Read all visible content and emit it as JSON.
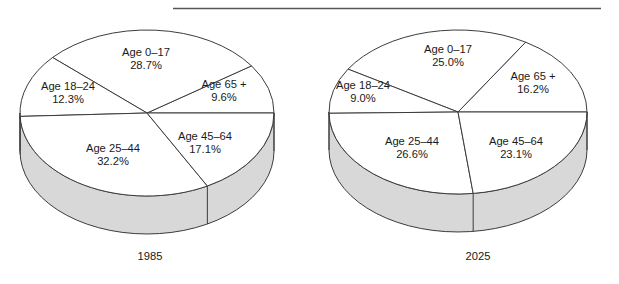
{
  "figure": {
    "top_rule": {
      "visible": true
    },
    "background_color": "#ffffff",
    "outline_color": "#3c3c3c",
    "slice_fill_color": "#ffffff",
    "side_wall_color": "#d8d8d8"
  },
  "chart_data": [
    {
      "type": "pie",
      "title": "1985",
      "xlabel": "",
      "ylabel": "",
      "categories": [
        "Age 65 +",
        "Age 0–17",
        "Age 18–24",
        "Age 25–44",
        "Age 45–64"
      ],
      "values": [
        9.6,
        28.7,
        12.3,
        32.2,
        17.1
      ],
      "labels": [
        "Age 65 +",
        "Age 0–17",
        "Age 18–24",
        "Age 25–44",
        "Age 45–64"
      ],
      "value_labels": [
        "9.6%",
        "28.7%",
        "12.3%",
        "32.2%",
        "17.1%"
      ],
      "legend_position": "none",
      "grid": false,
      "style": "3d-pie",
      "start_angle_deg": 0,
      "direction": "counterclockwise"
    },
    {
      "type": "pie",
      "title": "2025",
      "xlabel": "",
      "ylabel": "",
      "categories": [
        "Age 65 +",
        "Age 0–17",
        "Age 18–24",
        "Age 25–44",
        "Age 45–64"
      ],
      "values": [
        16.2,
        25.0,
        9.0,
        26.6,
        23.1
      ],
      "labels": [
        "Age 65 +",
        "Age 0–17",
        "Age 18–24",
        "Age 25–44",
        "Age 45–64"
      ],
      "value_labels": [
        "16.2%",
        "25.0%",
        "9.0%",
        "26.6%",
        "23.1%"
      ],
      "legend_position": "none",
      "grid": false,
      "style": "3d-pie",
      "start_angle_deg": 0,
      "direction": "counterclockwise"
    }
  ],
  "charts": [
    {
      "id": "pie-1985",
      "year_label": "1985",
      "slices": [
        {
          "name": "Age 65 +",
          "label": "Age 65 +",
          "percent_label": "9.6%",
          "percent": 9.6,
          "label_x": 224,
          "label_y": 88,
          "pct_x": 224,
          "pct_y": 101
        },
        {
          "name": "Age 0-17",
          "label": "Age 0–17",
          "percent_label": "28.7%",
          "percent": 28.7,
          "label_x": 146,
          "label_y": 56,
          "pct_x": 146,
          "pct_y": 69
        },
        {
          "name": "Age 18-24",
          "label": "Age 18–24",
          "percent_label": "12.3%",
          "percent": 12.3,
          "label_x": 68,
          "label_y": 90,
          "pct_x": 68,
          "pct_y": 103
        },
        {
          "name": "Age 25-44",
          "label": "Age 25–44",
          "percent_label": "32.2%",
          "percent": 32.2,
          "label_x": 113,
          "label_y": 152,
          "pct_x": 113,
          "pct_y": 165
        },
        {
          "name": "Age 45-64",
          "label": "Age 45–64",
          "percent_label": "17.1%",
          "percent": 17.1,
          "label_x": 205,
          "label_y": 140,
          "pct_x": 205,
          "pct_y": 153
        }
      ]
    },
    {
      "id": "pie-2025",
      "year_label": "2025",
      "slices": [
        {
          "name": "Age 65 +",
          "label": "Age 65 +",
          "percent_label": "16.2%",
          "percent": 16.2,
          "label_x": 533,
          "label_y": 80,
          "pct_x": 533,
          "pct_y": 93
        },
        {
          "name": "Age 0-17",
          "label": "Age 0–17",
          "percent_label": "25.0%",
          "percent": 25.0,
          "label_x": 448,
          "label_y": 53,
          "pct_x": 448,
          "pct_y": 66
        },
        {
          "name": "Age 18-24",
          "label": "Age 18–24",
          "percent_label": "9.0%",
          "percent": 9.0,
          "label_x": 363,
          "label_y": 89,
          "pct_x": 363,
          "pct_y": 102
        },
        {
          "name": "Age 25-44",
          "label": "Age 25–44",
          "percent_label": "26.6%",
          "percent": 26.6,
          "label_x": 412,
          "label_y": 145,
          "pct_x": 412,
          "pct_y": 158
        },
        {
          "name": "Age 45-64",
          "label": "Age 45–64",
          "percent_label": "23.1%",
          "percent": 23.1,
          "label_x": 516,
          "label_y": 145,
          "pct_x": 516,
          "pct_y": 158
        }
      ]
    }
  ]
}
